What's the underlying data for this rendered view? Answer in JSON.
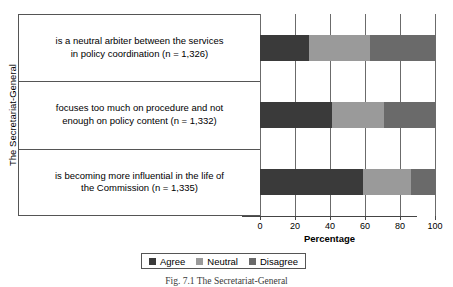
{
  "chart_data": {
    "type": "bar",
    "orientation": "horizontal",
    "stacked": true,
    "title": "",
    "xlabel": "Percentage",
    "ylabel": "The Secretariat-General",
    "xlim": [
      0,
      100
    ],
    "xticks": [
      0,
      20,
      40,
      60,
      80,
      100
    ],
    "xticklabels": [
      "0",
      "20",
      "40",
      "60",
      "80",
      "100"
    ],
    "grid": true,
    "grid_axis": "x",
    "legend_position": "bottom",
    "categories": [
      "is a neutral arbiter between the services in policy coordination (n = 1,326)",
      "focuses too much on procedure and not enough on policy content (n = 1,332)",
      "is becoming more influential in the life of the Commission (n = 1,335)"
    ],
    "category_lines": [
      [
        "is a neutral arbiter between the services",
        "in policy coordination (n = 1,326)"
      ],
      [
        "focuses too much on procedure and not",
        "enough on policy content (n = 1,332)"
      ],
      [
        "is becoming more influential in the life of",
        "the Commission (n = 1,335)"
      ]
    ],
    "series": [
      {
        "name": "Agree",
        "color": "#3a3a3a",
        "values": [
          28,
          41,
          59
        ]
      },
      {
        "name": "Neutral",
        "color": "#9a9a9a",
        "values": [
          35,
          30,
          27
        ]
      },
      {
        "name": "Disagree",
        "color": "#6a6a6a",
        "values": [
          37,
          29,
          14
        ]
      }
    ]
  },
  "legend": {
    "items": [
      {
        "label": "Agree",
        "color": "#3a3a3a"
      },
      {
        "label": "Neutral",
        "color": "#9a9a9a"
      },
      {
        "label": "Disagree",
        "color": "#6a6a6a"
      }
    ]
  },
  "axes": {
    "x_title": "Percentage",
    "y_title": "The Secretariat-General"
  },
  "caption": "Fig. 7.1 The Secretariat-General"
}
